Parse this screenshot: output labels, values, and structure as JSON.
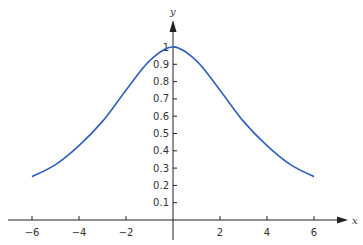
{
  "chart_data": {
    "type": "line",
    "title": "",
    "xlabel": "x",
    "ylabel": "y",
    "xlim": [
      -6.8,
      7.2
    ],
    "ylim": [
      0,
      1.1
    ],
    "grid": false,
    "legend": null,
    "x_ticks": [
      -6,
      -4,
      -2,
      2,
      4,
      6
    ],
    "x_tick_labels": [
      "−6",
      "−4",
      "−2",
      "2",
      "4",
      "6"
    ],
    "y_ticks": [
      0.1,
      0.2,
      0.3,
      0.4,
      0.5,
      0.6,
      0.7,
      0.8,
      0.9,
      1
    ],
    "y_tick_labels": [
      "0.1",
      "0.2",
      "0.3",
      "0.4",
      "0.5",
      "0.6",
      "0.7",
      "0.8",
      "0.9",
      "1"
    ],
    "series": [
      {
        "name": "y = 1/(1 + x^2/12)",
        "color": "#2f5fbf",
        "x": [
          -6,
          -5,
          -4,
          -3,
          -2,
          -1,
          0,
          1,
          2,
          3,
          4,
          5,
          6
        ],
        "values": [
          0.25,
          0.32,
          0.43,
          0.57,
          0.75,
          0.92,
          1.0,
          0.92,
          0.75,
          0.57,
          0.43,
          0.32,
          0.25
        ]
      }
    ]
  },
  "colors": {
    "axis": "#222222",
    "curve": "#2f5fbf"
  }
}
